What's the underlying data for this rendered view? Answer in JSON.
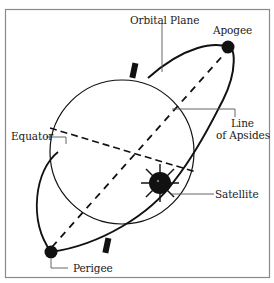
{
  "diagram": {
    "labels": {
      "orbital_plane": "Orbital Plane",
      "apogee": "Apogee",
      "line_of_apsides_1": "Line",
      "line_of_apsides_2": "of Apsides",
      "equator": "Equator",
      "satellite": "Satellite",
      "perigee": "Perigee"
    },
    "colors": {
      "frame": "#8a8a8a",
      "ink": "#111111",
      "background": "#ffffff",
      "leader": "#555555"
    }
  }
}
